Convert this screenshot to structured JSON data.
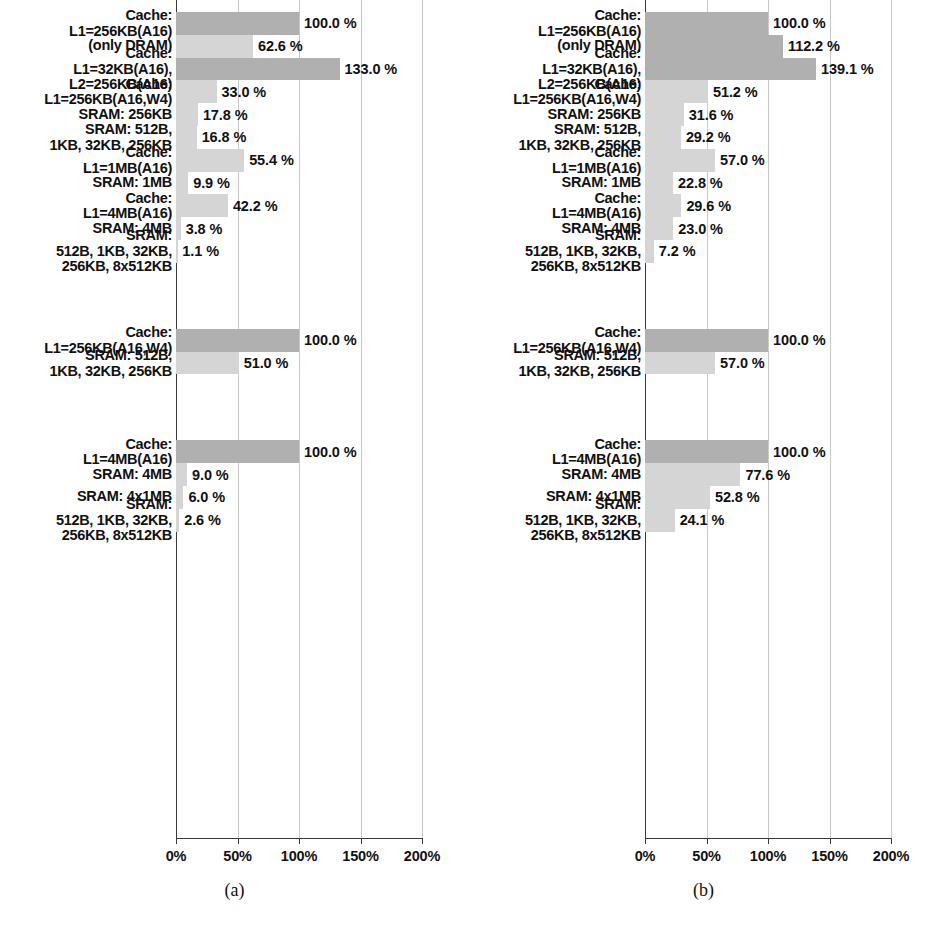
{
  "figure": {
    "width": 938,
    "height": 932,
    "background": "#ffffff",
    "colors": {
      "cache_bar": "#b0b0b0",
      "sram_bar": "#d5d5d5",
      "axis": "#3a3a3a",
      "gridline": "#c9c9c9",
      "text": "#111111"
    }
  },
  "panels": [
    {
      "caption": "(a)"
    },
    {
      "caption": "(b)"
    }
  ],
  "axis": {
    "ticks": [
      "0%",
      "50%",
      "100%",
      "150%",
      "200%"
    ],
    "tick_values": [
      0,
      50,
      100,
      150,
      200
    ],
    "min": 0,
    "max": 200
  },
  "chart_data": [
    {
      "type": "bar",
      "orientation": "horizontal",
      "title": "(a)",
      "xlabel": "",
      "ylabel": "",
      "xlim": [
        0,
        200
      ],
      "xticks": [
        0,
        50,
        100,
        150,
        200
      ],
      "xticklabels": [
        "0%",
        "50%",
        "100%",
        "150%",
        "200%"
      ],
      "grid": true,
      "legend": "none",
      "groups": [
        {
          "group_index": 0,
          "bars": [
            {
              "label": "Cache:\nL1=256KB(A16)",
              "value": 100.0,
              "value_label": "100.0 %",
              "kind": "cache"
            },
            {
              "label": "(only DRAM)",
              "value": 62.6,
              "value_label": "62.6 %",
              "kind": "sram"
            },
            {
              "label": "Cache:\nL1=32KB(A16),\nL2=256KB(A16)",
              "value": 133.0,
              "value_label": "133.0 %",
              "kind": "cache"
            },
            {
              "label": "Cache:\nL1=256KB(A16,W4)",
              "value": 33.0,
              "value_label": "33.0 %",
              "kind": "sram"
            },
            {
              "label": "SRAM: 256KB",
              "value": 17.8,
              "value_label": "17.8 %",
              "kind": "sram"
            },
            {
              "label": "SRAM: 512B,\n1KB, 32KB, 256KB",
              "value": 16.8,
              "value_label": "16.8 %",
              "kind": "sram"
            },
            {
              "label": "Cache:\nL1=1MB(A16)",
              "value": 55.4,
              "value_label": "55.4 %",
              "kind": "sram"
            },
            {
              "label": "SRAM: 1MB",
              "value": 9.9,
              "value_label": "9.9 %",
              "kind": "sram"
            },
            {
              "label": "Cache:\nL1=4MB(A16)",
              "value": 42.2,
              "value_label": "42.2 %",
              "kind": "sram"
            },
            {
              "label": "SRAM: 4MB",
              "value": 3.8,
              "value_label": "3.8 %",
              "kind": "sram"
            },
            {
              "label": "SRAM:\n512B, 1KB, 32KB,\n256KB, 8x512KB",
              "value": 1.1,
              "value_label": "1.1 %",
              "kind": "sram"
            }
          ]
        },
        {
          "group_index": 1,
          "bars": [
            {
              "label": "Cache:\nL1=256KB(A16,W4)",
              "value": 100.0,
              "value_label": "100.0 %",
              "kind": "cache"
            },
            {
              "label": "SRAM: 512B,\n1KB, 32KB, 256KB",
              "value": 51.0,
              "value_label": "51.0 %",
              "kind": "sram"
            }
          ]
        },
        {
          "group_index": 2,
          "bars": [
            {
              "label": "Cache:\nL1=4MB(A16)",
              "value": 100.0,
              "value_label": "100.0 %",
              "kind": "cache"
            },
            {
              "label": "SRAM: 4MB",
              "value": 9.0,
              "value_label": "9.0 %",
              "kind": "sram"
            },
            {
              "label": "SRAM: 4x1MB",
              "value": 6.0,
              "value_label": "6.0 %",
              "kind": "sram"
            },
            {
              "label": "SRAM:\n512B, 1KB, 32KB,\n256KB, 8x512KB",
              "value": 2.6,
              "value_label": "2.6 %",
              "kind": "sram"
            }
          ]
        }
      ]
    },
    {
      "type": "bar",
      "orientation": "horizontal",
      "title": "(b)",
      "xlabel": "",
      "ylabel": "",
      "xlim": [
        0,
        200
      ],
      "xticks": [
        0,
        50,
        100,
        150,
        200
      ],
      "xticklabels": [
        "0%",
        "50%",
        "100%",
        "150%",
        "200%"
      ],
      "grid": true,
      "legend": "none",
      "groups": [
        {
          "group_index": 0,
          "bars": [
            {
              "label": "Cache:\nL1=256KB(A16)",
              "value": 100.0,
              "value_label": "100.0 %",
              "kind": "cache"
            },
            {
              "label": "(only DRAM)",
              "value": 112.2,
              "value_label": "112.2 %",
              "kind": "cache"
            },
            {
              "label": "Cache:\nL1=32KB(A16),\nL2=256KB(A16)",
              "value": 139.1,
              "value_label": "139.1 %",
              "kind": "cache"
            },
            {
              "label": "Cache:\nL1=256KB(A16,W4)",
              "value": 51.2,
              "value_label": "51.2 %",
              "kind": "sram"
            },
            {
              "label": "SRAM: 256KB",
              "value": 31.6,
              "value_label": "31.6 %",
              "kind": "sram"
            },
            {
              "label": "SRAM: 512B,\n1KB, 32KB, 256KB",
              "value": 29.2,
              "value_label": "29.2 %",
              "kind": "sram"
            },
            {
              "label": "Cache:\nL1=1MB(A16)",
              "value": 57.0,
              "value_label": "57.0 %",
              "kind": "sram"
            },
            {
              "label": "SRAM: 1MB",
              "value": 22.8,
              "value_label": "22.8 %",
              "kind": "sram"
            },
            {
              "label": "Cache:\nL1=4MB(A16)",
              "value": 29.6,
              "value_label": "29.6 %",
              "kind": "sram"
            },
            {
              "label": "SRAM: 4MB",
              "value": 23.0,
              "value_label": "23.0 %",
              "kind": "sram"
            },
            {
              "label": "SRAM:\n512B, 1KB, 32KB,\n256KB, 8x512KB",
              "value": 7.2,
              "value_label": "7.2 %",
              "kind": "sram"
            }
          ]
        },
        {
          "group_index": 1,
          "bars": [
            {
              "label": "Cache:\nL1=256KB(A16,W4)",
              "value": 100.0,
              "value_label": "100.0 %",
              "kind": "cache"
            },
            {
              "label": "SRAM: 512B,\n1KB, 32KB, 256KB",
              "value": 57.0,
              "value_label": "57.0 %",
              "kind": "sram"
            }
          ]
        },
        {
          "group_index": 2,
          "bars": [
            {
              "label": "Cache:\nL1=4MB(A16)",
              "value": 100.0,
              "value_label": "100.0 %",
              "kind": "cache"
            },
            {
              "label": "SRAM: 4MB",
              "value": 77.6,
              "value_label": "77.6 %",
              "kind": "sram"
            },
            {
              "label": "SRAM: 4x1MB",
              "value": 52.8,
              "value_label": "52.8 %",
              "kind": "sram"
            },
            {
              "label": "SRAM:\n512B, 1KB, 32KB,\n256KB, 8x512KB",
              "value": 24.1,
              "value_label": "24.1 %",
              "kind": "sram"
            }
          ]
        }
      ]
    }
  ]
}
